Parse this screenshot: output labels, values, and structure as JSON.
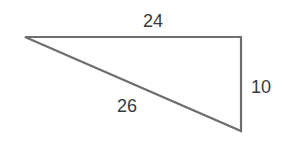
{
  "figure": {
    "type": "right-triangle",
    "stroke_color": "#6e6e6e",
    "text_color": "#3a3a3a",
    "vertices": {
      "left": [
        25,
        37
      ],
      "top_right": [
        241,
        37
      ],
      "bottom_right": [
        241,
        131
      ]
    },
    "labels": {
      "top_side": "24",
      "right_side": "10",
      "hypotenuse": "26"
    }
  }
}
